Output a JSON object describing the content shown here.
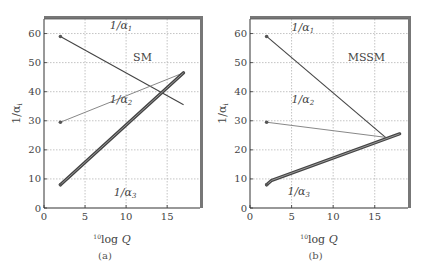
{
  "chart_data": [
    {
      "type": "line",
      "panel": "(a)",
      "title": "SM",
      "xlabel": "10log Q",
      "xlabel_superscript": "10",
      "xlabel_main": "log Q",
      "ylabel": "1/αi",
      "xlim": [
        0,
        19
      ],
      "ylim": [
        0,
        65
      ],
      "xticks": [
        0,
        5,
        10,
        15
      ],
      "yticks": [
        0,
        10,
        20,
        30,
        40,
        50,
        60
      ],
      "grid": true,
      "series": [
        {
          "name": "1/α1",
          "label_main": "1/α",
          "label_sub": "1",
          "x": [
            2,
            17
          ],
          "y": [
            59,
            35.5
          ],
          "style": "dark-thin",
          "label_pos": [
            8,
            61.5
          ]
        },
        {
          "name": "1/α2",
          "label_main": "1/α",
          "label_sub": "2",
          "x": [
            2,
            17
          ],
          "y": [
            29.5,
            46.5
          ],
          "style": "gray-thin",
          "label_pos": [
            8,
            36
          ]
        },
        {
          "name": "1/α3",
          "label_main": "1/α",
          "label_sub": "3",
          "x": [
            2,
            17
          ],
          "y": [
            8,
            46.5
          ],
          "style": "thick",
          "label_pos": [
            8.5,
            4
          ]
        }
      ],
      "annotations": [
        {
          "text": "SM",
          "x": 12,
          "y": 50.5
        }
      ]
    },
    {
      "type": "line",
      "panel": "(b)",
      "title": "MSSM",
      "xlabel": "10log Q",
      "xlabel_superscript": "10",
      "xlabel_main": "log Q",
      "ylabel": "1/αi",
      "xlim": [
        0,
        19
      ],
      "ylim": [
        0,
        65
      ],
      "xticks": [
        0,
        5,
        10,
        15
      ],
      "yticks": [
        0,
        10,
        20,
        30,
        40,
        50,
        60
      ],
      "grid": true,
      "series": [
        {
          "name": "1/α1",
          "label_main": "1/α",
          "label_sub": "1",
          "x": [
            2,
            16.3
          ],
          "y": [
            59,
            24.3
          ],
          "style": "dark-thin",
          "label_pos": [
            5,
            61
          ]
        },
        {
          "name": "1/α2",
          "label_main": "1/α",
          "label_sub": "2",
          "x": [
            2,
            16.3
          ],
          "y": [
            29.5,
            24.3
          ],
          "style": "gray-thin",
          "label_pos": [
            5,
            36
          ]
        },
        {
          "name": "1/α3",
          "label_main": "1/α",
          "label_sub": "3",
          "x": [
            2,
            2.6,
            18
          ],
          "y": [
            8,
            9.5,
            25.5
          ],
          "style": "thick",
          "label_pos": [
            4.5,
            4.5
          ]
        }
      ],
      "annotations": [
        {
          "text": "MSSM",
          "x": 14,
          "y": 50.5
        }
      ]
    }
  ],
  "captions": {
    "a": "(a)",
    "b": "(b)"
  }
}
